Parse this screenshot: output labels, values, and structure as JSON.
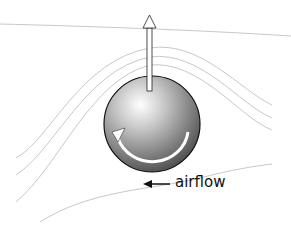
{
  "diagram": {
    "label_airflow": "airflow",
    "elements": [
      "streamlines",
      "sphere",
      "lift-arrow",
      "rotation-arrow",
      "airflow-arrow"
    ],
    "colors": {
      "streamline": "#c8c8c8",
      "sphere_light": "#f2f2f2",
      "sphere_dark": "#4a4a4a",
      "outline": "#111111",
      "arrow_fill": "#ffffff"
    }
  }
}
